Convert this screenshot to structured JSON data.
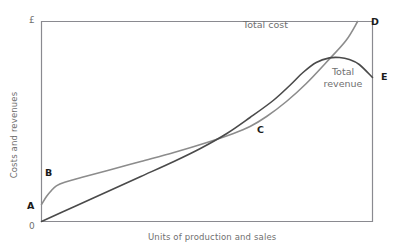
{
  "chart_data": {
    "type": "line",
    "title": "",
    "xlabel": "Units of production and sales",
    "ylabel": "Costs and revenues",
    "y_axis_symbol": "£",
    "origin_label": "0",
    "grid": false,
    "legend_position": "inline-annotations",
    "xlim": [
      0,
      100
    ],
    "ylim": [
      0,
      100
    ],
    "axis_ticks": [],
    "series": [
      {
        "name": "Total cost",
        "color": "#8c8c8c",
        "label_x": 61,
        "label_y": 96,
        "points": [
          {
            "x": 0,
            "y": 8.5
          },
          {
            "x": 1.5,
            "y": 12.5
          },
          {
            "x": 3,
            "y": 15.5
          },
          {
            "x": 4.5,
            "y": 17.8
          },
          {
            "x": 7,
            "y": 19.6
          },
          {
            "x": 12,
            "y": 22.0
          },
          {
            "x": 20,
            "y": 25.5
          },
          {
            "x": 30,
            "y": 30.0
          },
          {
            "x": 40,
            "y": 34.5
          },
          {
            "x": 50,
            "y": 39.5
          },
          {
            "x": 58,
            "y": 44.0
          },
          {
            "x": 63,
            "y": 47.5
          },
          {
            "x": 68,
            "y": 52.5
          },
          {
            "x": 74,
            "y": 60.0
          },
          {
            "x": 80,
            "y": 69.0
          },
          {
            "x": 86,
            "y": 79.5
          },
          {
            "x": 92,
            "y": 90.5
          },
          {
            "x": 95.5,
            "y": 100
          }
        ]
      },
      {
        "name": "Total revenue",
        "color": "#4a4a4a",
        "label_x": 84,
        "label_y": 75,
        "points": [
          {
            "x": 0,
            "y": 0
          },
          {
            "x": 10,
            "y": 7.5
          },
          {
            "x": 20,
            "y": 15.0
          },
          {
            "x": 30,
            "y": 22.5
          },
          {
            "x": 40,
            "y": 30.0
          },
          {
            "x": 48,
            "y": 36.5
          },
          {
            "x": 56,
            "y": 44.0
          },
          {
            "x": 63,
            "y": 52.0
          },
          {
            "x": 70,
            "y": 60.5
          },
          {
            "x": 75,
            "y": 68.0
          },
          {
            "x": 79,
            "y": 74.5
          },
          {
            "x": 83,
            "y": 79.5
          },
          {
            "x": 87,
            "y": 81.8
          },
          {
            "x": 90,
            "y": 82.0
          },
          {
            "x": 93,
            "y": 81.0
          },
          {
            "x": 96,
            "y": 78.5
          },
          {
            "x": 100,
            "y": 72.0
          }
        ]
      }
    ],
    "annotations": [
      {
        "id": "A",
        "label": "A",
        "description": "fixed-cost intercept of total cost curve on vertical axis"
      },
      {
        "id": "B",
        "label": "B",
        "description": "end of steeply rising initial section of total cost curve"
      },
      {
        "id": "C",
        "label": "C",
        "description": "point where total cost curve begins to rise steeply again"
      },
      {
        "id": "D",
        "label": "D",
        "description": "upper end of total cost curve at top of chart"
      },
      {
        "id": "E",
        "label": "E",
        "description": "right end of total revenue curve at right edge of chart"
      }
    ]
  },
  "labels": {
    "total_cost": "Total cost",
    "total_revenue_line1": "Total",
    "total_revenue_line2": "revenue",
    "point_a": "A",
    "point_b": "B",
    "point_c": "C",
    "point_d": "D",
    "point_e": "E"
  },
  "colors": {
    "total_cost": "#8c8c8c",
    "total_revenue": "#4a4a4a",
    "frame": "#8a8a90",
    "axis_text": "#6f6f6f",
    "point_text": "#1a1a1a",
    "background": "#ffffff"
  }
}
